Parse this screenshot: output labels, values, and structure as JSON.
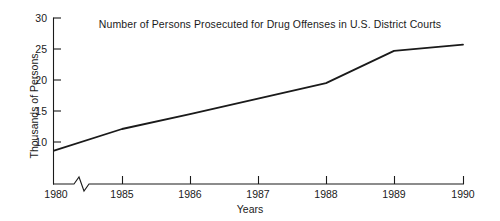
{
  "chart_data": {
    "type": "line",
    "title": "Number of Persons Prosecuted for Drug Offenses in U.S. District Courts",
    "xlabel": "Years",
    "ylabel": "Thousands of Persons",
    "x": [
      "1980",
      "1985",
      "1986",
      "1987",
      "1988",
      "1989",
      "1990"
    ],
    "values": [
      8.6,
      12.1,
      14.5,
      17.0,
      19.5,
      24.7,
      25.7
    ],
    "series": [
      {
        "name": "Persons prosecuted",
        "values": [
          8.6,
          12.1,
          14.5,
          17.0,
          19.5,
          24.7,
          25.7
        ]
      }
    ],
    "xtick_labels": [
      "1980",
      "1985",
      "1986",
      "1987",
      "1988",
      "1989",
      "1990"
    ],
    "ytick_labels": [
      "10",
      "15",
      "20",
      "25",
      "30"
    ],
    "ytick_values": [
      10,
      15,
      20,
      25,
      30
    ],
    "ylim": [
      6,
      30
    ],
    "grid": false,
    "legend": false,
    "axis_break": {
      "axis": "x",
      "between": [
        "1980",
        "1985"
      ],
      "style": "zigzag"
    },
    "line_color": "#1a1a1a",
    "background_color": "#ffffff"
  }
}
